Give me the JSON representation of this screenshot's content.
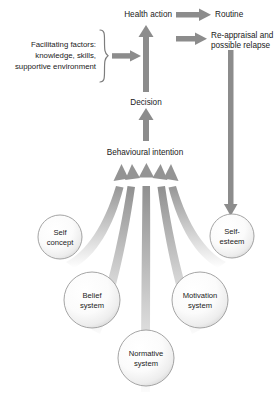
{
  "diagram": {
    "background_color": "#ffffff",
    "arrow_color": "#8c8c8c",
    "text_color": "#1a1a1a",
    "circle_stroke_color": "#9a9a9a",
    "nodes": {
      "health_action": "Health action",
      "routine": "Routine",
      "reappraisal_line1": "Re-appraisal and",
      "reappraisal_line2": "possible relapse",
      "decision": "Decision",
      "behavioural_intention": "Behavioural intention",
      "facilitating_line1": "Facilitating factors:",
      "facilitating_line2": "knowledge, skills,",
      "facilitating_line3": "supportive environment"
    },
    "circles": [
      {
        "id": "self-concept",
        "line1": "Self",
        "line2": "concept",
        "cx": 60,
        "cy": 237,
        "r": 22
      },
      {
        "id": "self-esteem",
        "line1": "Self-",
        "line2": "esteem",
        "cx": 232,
        "cy": 236,
        "r": 22
      },
      {
        "id": "belief-system",
        "line1": "Belief",
        "line2": "system",
        "cx": 92,
        "cy": 300,
        "r": 28
      },
      {
        "id": "motivation-system",
        "line1": "Motivation",
        "line2": "system",
        "cx": 200,
        "cy": 300,
        "r": 28
      },
      {
        "id": "normative-system",
        "line1": "Normative",
        "line2": "system",
        "cx": 146,
        "cy": 358,
        "r": 28
      }
    ],
    "icons": {
      "brace": "curly-brace-icon",
      "up_arrow": "arrow-up-icon",
      "right_arrow": "arrow-right-icon",
      "down_arrow": "arrow-down-icon",
      "curved_arrow": "curved-arrow-up-icon"
    }
  }
}
